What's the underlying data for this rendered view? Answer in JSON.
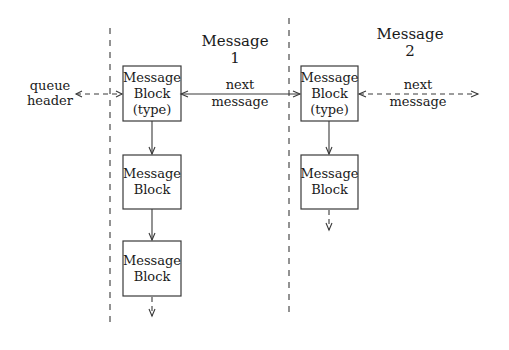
{
  "diagram": {
    "columns": [
      {
        "id": "message-1",
        "title_line1": "Message",
        "title_line2": "1"
      },
      {
        "id": "message-2",
        "title_line1": "Message",
        "title_line2": "2"
      }
    ],
    "queue_header": {
      "line1": "queue",
      "line2": "header"
    },
    "links": {
      "next_message_1": {
        "line1": "next",
        "line2": "message"
      },
      "next_message_2": {
        "line1": "next",
        "line2": "message"
      }
    },
    "message1_blocks": [
      {
        "line1": "Message",
        "line2": "Block",
        "line3": "(type)"
      },
      {
        "line1": "Message",
        "line2": "Block"
      },
      {
        "line1": "Message",
        "line2": "Block"
      }
    ],
    "message2_blocks": [
      {
        "line1": "Message",
        "line2": "Block",
        "line3": "(type)"
      },
      {
        "line1": "Message",
        "line2": "Block"
      }
    ]
  }
}
